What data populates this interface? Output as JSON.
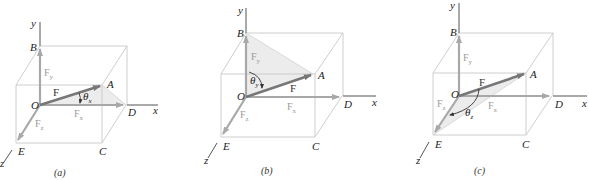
{
  "figure": {
    "panels": [
      {
        "id": "a",
        "caption": "(a)",
        "points": {
          "y": "y",
          "x": "x",
          "z": "z",
          "B": "B",
          "O": "O",
          "A": "A",
          "D": "D",
          "E": "E",
          "C": "C"
        },
        "vectors": {
          "F": "F",
          "Fx": "F",
          "Fx_sub": "x",
          "Fy": "F",
          "Fy_sub": "y",
          "Fz": "F",
          "Fz_sub": "z"
        },
        "angle": {
          "symbol": "θ",
          "sub": "x"
        },
        "shaded_triangle": "O-A-D"
      },
      {
        "id": "b",
        "caption": "(b)",
        "points": {
          "y": "y",
          "x": "x",
          "z": "z",
          "B": "B",
          "O": "O",
          "A": "A",
          "D": "D",
          "E": "E",
          "C": "C"
        },
        "vectors": {
          "F": "F",
          "Fx": "F",
          "Fx_sub": "x",
          "Fy": "F",
          "Fy_sub": "y",
          "Fz": "F",
          "Fz_sub": "z"
        },
        "angle": {
          "symbol": "θ",
          "sub": "y"
        },
        "shaded_triangle": "O-B-A"
      },
      {
        "id": "c",
        "caption": "(c)",
        "points": {
          "y": "y",
          "x": "x",
          "z": "z",
          "B": "B",
          "O": "O",
          "A": "A",
          "D": "D",
          "E": "E",
          "C": "C"
        },
        "vectors": {
          "F": "F",
          "Fx": "F",
          "Fx_sub": "x",
          "Fy": "F",
          "Fy_sub": "y",
          "Fz": "F",
          "Fz_sub": "z"
        },
        "angle": {
          "symbol": "θ",
          "sub": "z"
        },
        "shaded_triangle": "O-A-E"
      }
    ],
    "colors": {
      "box_edges": "#c8c8c8",
      "force_vector": "#777777",
      "component_vectors": "#a8a8a8",
      "axes": "#555555",
      "shading": "#ececec"
    }
  }
}
